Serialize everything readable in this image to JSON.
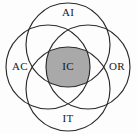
{
  "diagram": {
    "type": "four-circle-venn",
    "title": "",
    "background_color": "#fdfdfd",
    "stroke_color": "#2b2b2b",
    "intersection_fill": "#a9a9a9",
    "canvas": {
      "width": 137,
      "height": 134
    },
    "circle_radius": 42,
    "sets": [
      {
        "id": "ai",
        "label": "AI",
        "position": "top",
        "center": {
          "x": 68,
          "y": 45
        },
        "label_position": {
          "x": 68,
          "y": 13
        }
      },
      {
        "id": "ac",
        "label": "AC",
        "position": "left",
        "center": {
          "x": 48,
          "y": 67
        },
        "label_position": {
          "x": 20,
          "y": 67
        }
      },
      {
        "id": "or",
        "label": "OR",
        "position": "right",
        "center": {
          "x": 88,
          "y": 67
        },
        "label_position": {
          "x": 117,
          "y": 67
        }
      },
      {
        "id": "it",
        "label": "IT",
        "position": "bottom",
        "center": {
          "x": 68,
          "y": 89
        },
        "label_position": {
          "x": 68,
          "y": 119
        }
      }
    ],
    "intersection": {
      "id": "ic",
      "label": "IC",
      "label_position": {
        "x": 68,
        "y": 67
      },
      "fill": "#a9a9a9"
    }
  }
}
